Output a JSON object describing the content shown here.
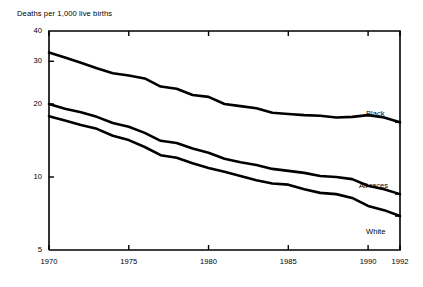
{
  "chart_data": {
    "type": "line",
    "title": "Deaths per 1,000 live births",
    "xlabel": "",
    "ylabel": "Deaths per 1,000 live births",
    "yscale": "log",
    "ylim": [
      5,
      40
    ],
    "xlim": [
      1970,
      1992
    ],
    "grid": false,
    "legend_position": "right-inline-labels",
    "y_ticks": [
      "40",
      "30",
      "20",
      "10",
      "5"
    ],
    "y_tick_values": [
      40,
      30,
      20,
      10,
      5
    ],
    "x_ticks": [
      "1970",
      "1975",
      "1980",
      "1985",
      "1990",
      "1992"
    ],
    "x_tick_values": [
      1970,
      1975,
      1980,
      1985,
      1990,
      1992
    ],
    "x": [
      1970,
      1971,
      1972,
      1973,
      1974,
      1975,
      1976,
      1977,
      1978,
      1979,
      1980,
      1981,
      1982,
      1983,
      1984,
      1985,
      1986,
      1987,
      1988,
      1989,
      1990,
      1991,
      1992
    ],
    "series": [
      {
        "name": "Black",
        "color": "#000000",
        "label_position": {
          "x": 366,
          "y": 110
        },
        "values": [
          32.6,
          31.1,
          29.6,
          28.1,
          26.8,
          26.2,
          25.5,
          23.6,
          23.1,
          21.8,
          21.4,
          20.0,
          19.6,
          19.2,
          18.4,
          18.2,
          18.0,
          17.9,
          17.6,
          17.7,
          18.0,
          17.6,
          16.8
        ]
      },
      {
        "name": "All races",
        "color": "#000000",
        "label_position": {
          "x": 359,
          "y": 182
        },
        "values": [
          20.0,
          19.1,
          18.5,
          17.7,
          16.7,
          16.1,
          15.2,
          14.1,
          13.8,
          13.1,
          12.6,
          11.9,
          11.5,
          11.2,
          10.8,
          10.6,
          10.4,
          10.1,
          10.0,
          9.8,
          9.2,
          8.9,
          8.5
        ]
      },
      {
        "name": "White",
        "color": "#000000",
        "label_position": {
          "x": 366,
          "y": 228
        },
        "values": [
          17.8,
          17.1,
          16.4,
          15.8,
          14.8,
          14.2,
          13.3,
          12.3,
          12.0,
          11.4,
          10.9,
          10.5,
          10.1,
          9.7,
          9.4,
          9.3,
          8.9,
          8.6,
          8.5,
          8.2,
          7.6,
          7.3,
          6.9
        ]
      }
    ],
    "plot_area": {
      "left": 49,
      "top": 31,
      "right": 400,
      "bottom": 250
    },
    "line_width": 2.6,
    "axis_color": "#000000"
  }
}
